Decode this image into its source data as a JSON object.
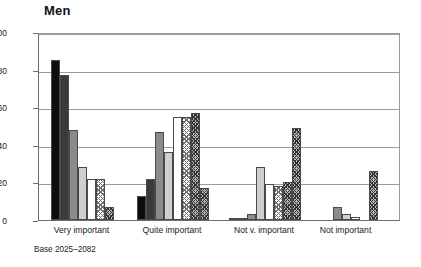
{
  "chart_data": {
    "type": "bar",
    "title": "Men",
    "xlabel": "",
    "ylabel": "",
    "ylim": [
      0,
      100
    ],
    "yticks": [
      0,
      20,
      40,
      60,
      80,
      100
    ],
    "grid": true,
    "legend": "none",
    "categories": [
      "Very important",
      "Quite important",
      "Not v. important",
      "Not important"
    ],
    "series": [
      {
        "name": "series-1",
        "fill": "solid-black",
        "values": [
          85,
          13,
          0.5,
          0
        ]
      },
      {
        "name": "series-2",
        "fill": "solid-dark-grey",
        "values": [
          77,
          22,
          0.5,
          0
        ]
      },
      {
        "name": "series-3",
        "fill": "solid-mid-grey",
        "values": [
          48,
          47,
          3,
          7
        ]
      },
      {
        "name": "series-4",
        "fill": "solid-light-grey",
        "values": [
          28,
          36,
          28,
          3
        ]
      },
      {
        "name": "series-5",
        "fill": "white",
        "values": [
          22,
          55,
          19,
          1.5
        ]
      },
      {
        "name": "series-6",
        "fill": "light-crosshatch",
        "values": [
          22,
          55,
          18,
          0
        ]
      },
      {
        "name": "series-7",
        "fill": "dark-crosshatch",
        "values": [
          7,
          57,
          20,
          26
        ]
      }
    ],
    "extra_bars": [
      {
        "category": "Quite important",
        "value": 17,
        "fill": "dark-crosshatch"
      },
      {
        "category": "Not v. important",
        "value": 49,
        "fill": "dark-crosshatch"
      }
    ],
    "annotations": {
      "base_note": "Base 2025–2082"
    }
  },
  "axis": {
    "y_labels": [
      "100",
      "80",
      "60",
      "40",
      "20",
      "0"
    ]
  },
  "colors": {
    "series_1": "#0d0d0d",
    "series_2": "#3a3a3a",
    "series_3": "#8b8b8b",
    "series_4": "#cfcfcf",
    "series_5": "#ffffff",
    "series_6": "#b9b9b9",
    "series_7": "#6f6f6f",
    "axis": "#6d6d6d",
    "grid": "#9d9d9d"
  }
}
